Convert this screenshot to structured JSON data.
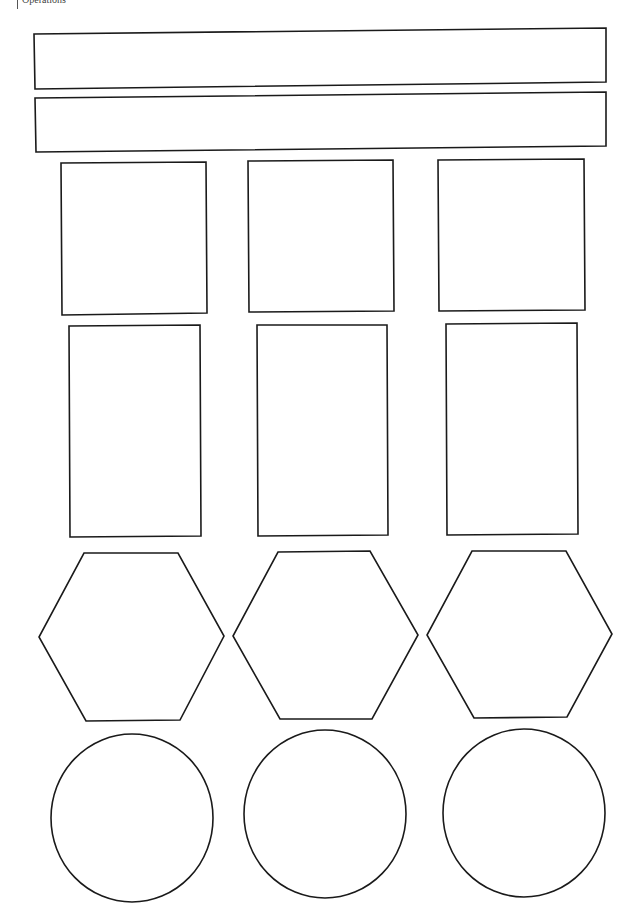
{
  "page": {
    "header_label": "Operations",
    "stroke_color": "#1a1a1a",
    "background_color": "#ffffff"
  },
  "banners": [
    {
      "id": "banner-1",
      "text": ""
    },
    {
      "id": "banner-2",
      "text": ""
    }
  ],
  "rows": [
    {
      "shape": "square",
      "count": 3
    },
    {
      "shape": "rectangle",
      "count": 3
    },
    {
      "shape": "hexagon",
      "count": 3
    },
    {
      "shape": "circle",
      "count": 3
    }
  ]
}
